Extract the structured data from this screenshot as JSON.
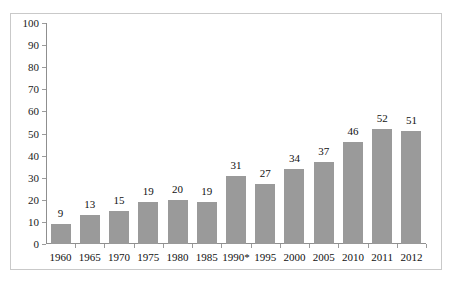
{
  "chart_data": {
    "type": "bar",
    "title": "",
    "subtitle": "",
    "xlabel": "",
    "ylabel": "",
    "ylim": [
      0,
      100
    ],
    "ytick_step": 10,
    "yticks": [
      0,
      10,
      20,
      30,
      40,
      50,
      60,
      70,
      80,
      90,
      100
    ],
    "grid": false,
    "legend": false,
    "bar_color": "#9a9a9a",
    "axis_color": "#8f8f8f",
    "frame_color": "#c9c9c9",
    "background": "#ffffff",
    "categories": [
      "1960",
      "1965",
      "1970",
      "1975",
      "1980",
      "1985",
      "1990*",
      "1995",
      "2000",
      "2005",
      "2010",
      "2011",
      "2012"
    ],
    "values": [
      9,
      13,
      15,
      19,
      20,
      19,
      31,
      27,
      34,
      37,
      46,
      52,
      51
    ],
    "data_labels": [
      "9",
      "13",
      "15",
      "19",
      "20",
      "19",
      "31",
      "27",
      "34",
      "37",
      "46",
      "52",
      "51"
    ]
  }
}
